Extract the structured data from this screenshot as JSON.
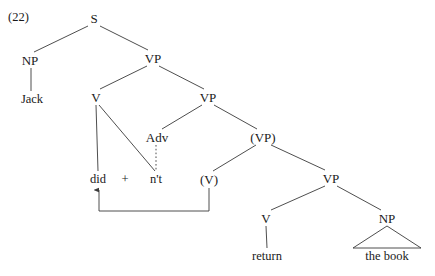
{
  "figure": {
    "example_number": "(22)",
    "type": "syntax-tree",
    "background_color": "#ffffff",
    "line_color": "#3a3a3a",
    "text_color": "#1a1a1a"
  },
  "nodes": [
    {
      "id": "s",
      "label": "S",
      "x": 94,
      "y": 18,
      "kind": "nonterminal"
    },
    {
      "id": "np-subj",
      "label": "NP",
      "x": 30,
      "y": 60,
      "kind": "nonterminal"
    },
    {
      "id": "jack",
      "label": "Jack",
      "x": 32,
      "y": 99,
      "kind": "terminal"
    },
    {
      "id": "vp1",
      "label": "VP",
      "x": 153,
      "y": 58,
      "kind": "nonterminal"
    },
    {
      "id": "v1",
      "label": "V",
      "x": 96,
      "y": 97,
      "kind": "nonterminal"
    },
    {
      "id": "vp2",
      "label": "VP",
      "x": 208,
      "y": 97,
      "kind": "nonterminal"
    },
    {
      "id": "adv",
      "label": "Adv",
      "x": 157,
      "y": 137,
      "kind": "nonterminal"
    },
    {
      "id": "vp3-trace",
      "label": "(VP)",
      "x": 263,
      "y": 137,
      "kind": "trace"
    },
    {
      "id": "did",
      "label": "did",
      "x": 98,
      "y": 179,
      "kind": "terminal"
    },
    {
      "id": "plus",
      "label": "+",
      "x": 125,
      "y": 179,
      "kind": "operator"
    },
    {
      "id": "nt",
      "label": "n't",
      "x": 156,
      "y": 179,
      "kind": "terminal"
    },
    {
      "id": "v-trace",
      "label": "(V)",
      "x": 209,
      "y": 179,
      "kind": "trace"
    },
    {
      "id": "vp4",
      "label": "VP",
      "x": 331,
      "y": 178,
      "kind": "nonterminal"
    },
    {
      "id": "v2",
      "label": "V",
      "x": 266,
      "y": 218,
      "kind": "nonterminal"
    },
    {
      "id": "np-obj",
      "label": "NP",
      "x": 387,
      "y": 218,
      "kind": "nonterminal"
    },
    {
      "id": "return",
      "label": "return",
      "x": 267,
      "y": 256,
      "kind": "terminal"
    },
    {
      "id": "the-book",
      "label": "the book",
      "x": 387,
      "y": 256,
      "kind": "terminal"
    }
  ],
  "branches": [
    {
      "from": "s",
      "to": "np-subj",
      "style": "solid"
    },
    {
      "from": "s",
      "to": "vp1",
      "style": "solid"
    },
    {
      "from": "np-subj",
      "to": "jack",
      "style": "solid"
    },
    {
      "from": "vp1",
      "to": "v1",
      "style": "solid"
    },
    {
      "from": "vp1",
      "to": "vp2",
      "style": "solid"
    },
    {
      "from": "v1",
      "to": "did",
      "style": "solid"
    },
    {
      "from": "v1",
      "to": "nt",
      "style": "solid"
    },
    {
      "from": "vp2",
      "to": "adv",
      "style": "solid"
    },
    {
      "from": "vp2",
      "to": "vp3-trace",
      "style": "solid"
    },
    {
      "from": "adv",
      "to": "nt",
      "style": "dotted"
    },
    {
      "from": "vp3-trace",
      "to": "v-trace",
      "style": "solid"
    },
    {
      "from": "vp3-trace",
      "to": "vp4",
      "style": "solid"
    },
    {
      "from": "vp4",
      "to": "v2",
      "style": "solid"
    },
    {
      "from": "vp4",
      "to": "np-obj",
      "style": "solid"
    },
    {
      "from": "v2",
      "to": "return",
      "style": "solid"
    }
  ],
  "movement_arrow": {
    "from_node": "v-trace",
    "to_node": "did",
    "path": "M 209 188 L 209 211 L 99 211 L 99 189",
    "arrowhead": "up"
  },
  "np_triangle": {
    "over_node": "np-obj",
    "apex_x": 387,
    "apex_y": 226,
    "base_left_x": 353,
    "base_right_x": 421,
    "base_y": 248
  }
}
